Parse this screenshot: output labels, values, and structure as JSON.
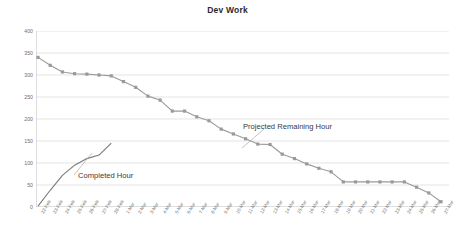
{
  "chart_data": {
    "type": "line",
    "title": "Dev Work",
    "xlabel": "",
    "ylabel": "",
    "ylim": [
      0,
      400
    ],
    "ytick_step": 50,
    "yticks": [
      0,
      50,
      100,
      150,
      200,
      250,
      300,
      350,
      400
    ],
    "grid": true,
    "legend_position": "none",
    "annotations": [
      {
        "text": "Projected Remaining Hour",
        "near_series": "Projected Remaining Hour"
      },
      {
        "text": "Completed Hour",
        "near_series": "Completed Hour"
      }
    ],
    "categories": [
      "22-Feb",
      "23-Feb",
      "24-Feb",
      "25-Feb",
      "26-Feb",
      "27-Feb",
      "28-Feb",
      "1-Mar",
      "2-Mar",
      "3-Mar",
      "4-Mar",
      "5-Mar",
      "6-Mar",
      "7-Mar",
      "8-Mar",
      "9-Mar",
      "10-Mar",
      "11-Mar",
      "12-Mar",
      "13-Mar",
      "14-Mar",
      "15-Mar",
      "16-Mar",
      "17-Mar",
      "18-Mar",
      "19-Mar",
      "20-Mar",
      "21-Mar",
      "22-Mar",
      "23-Mar",
      "24-Mar",
      "25-Mar",
      "26-Mar",
      "27-Mar"
    ],
    "series": [
      {
        "name": "Projected Remaining Hour",
        "color": "#9a9a9a",
        "marker": "square",
        "values": [
          340,
          322,
          307,
          303,
          302,
          300,
          298,
          285,
          272,
          252,
          243,
          218,
          218,
          205,
          196,
          177,
          166,
          155,
          143,
          142,
          120,
          110,
          98,
          88,
          80,
          57,
          57,
          57,
          57,
          57,
          57,
          45,
          32,
          12
        ]
      },
      {
        "name": "Completed Hour",
        "color": "#7a7a7a",
        "marker": "none",
        "values": [
          2,
          38,
          72,
          95,
          110,
          118,
          145,
          null,
          null,
          null,
          null,
          null,
          null,
          null,
          null,
          null,
          null,
          null,
          null,
          null,
          null,
          null,
          null,
          null,
          null,
          null,
          null,
          null,
          null,
          null,
          null,
          null,
          null,
          null
        ]
      }
    ]
  },
  "colors": {
    "grid": "#d9d9d9",
    "axis": "#b5b5b5",
    "text": "#6e6e6e",
    "title": "#2b2b2b"
  }
}
